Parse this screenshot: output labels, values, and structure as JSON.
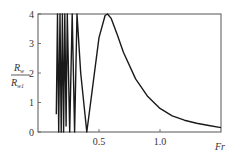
{
  "chart_data": {
    "type": "line",
    "title": "",
    "xlabel": "Fr",
    "ylabel": "R_w / R_w1",
    "ylabel_numerator": "R",
    "ylabel_numerator_sub": "w",
    "ylabel_denominator": "R",
    "ylabel_denominator_sub": "w1",
    "xlim": [
      0,
      1.5
    ],
    "ylim": [
      0,
      4
    ],
    "x_ticks": [
      0.5,
      1.0
    ],
    "x_tick_labels": [
      "0.5",
      "1.0"
    ],
    "y_ticks": [
      0,
      1,
      2,
      3,
      4
    ],
    "y_tick_labels": [
      "0",
      "1",
      "2",
      "3",
      "4"
    ],
    "grid": false,
    "legend": null,
    "series": [
      {
        "name": "R_w/R_w1",
        "note": "Rapid oscillation (clipped at 4) for Fr < 0.35, zero at Fr≈0.4, peak ≈4 at Fr≈0.57, then decay",
        "x": [
          0.15,
          0.16,
          0.17,
          0.18,
          0.19,
          0.2,
          0.21,
          0.22,
          0.23,
          0.24,
          0.26,
          0.28,
          0.3,
          0.32,
          0.35,
          0.4,
          0.45,
          0.5,
          0.55,
          0.57,
          0.6,
          0.65,
          0.7,
          0.8,
          0.9,
          1.0,
          1.1,
          1.2,
          1.3,
          1.4,
          1.5
        ],
        "y": [
          0.6,
          4.0,
          0.0,
          4.0,
          0.0,
          4.0,
          0.0,
          4.0,
          0.2,
          4.0,
          0.0,
          4.0,
          0.0,
          4.0,
          2.0,
          0.0,
          1.6,
          3.2,
          3.95,
          4.0,
          3.85,
          3.3,
          2.7,
          1.8,
          1.2,
          0.8,
          0.55,
          0.4,
          0.3,
          0.22,
          0.15
        ]
      }
    ]
  },
  "plot": {
    "line_color": "#1a1a1a",
    "frame_color": "#555555"
  }
}
